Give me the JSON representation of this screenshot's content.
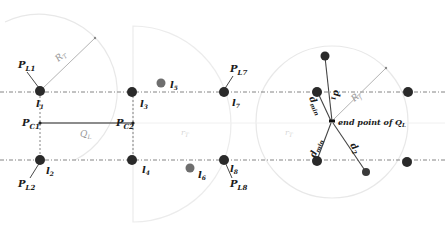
{
  "diagram": {
    "labels": {
      "PL1": {
        "main": "P",
        "sub": "L1"
      },
      "PL2": {
        "main": "P",
        "sub": "L2"
      },
      "PL7": {
        "main": "P",
        "sub": "L7"
      },
      "PL8": {
        "main": "P",
        "sub": "L8"
      },
      "PC1": {
        "main": "P",
        "sub": "C1"
      },
      "PC2": {
        "main": "P",
        "sub": "C2"
      },
      "RT": {
        "main": "R",
        "sub": "T"
      },
      "Rf": {
        "main": "R",
        "sub": "f"
      },
      "QL": {
        "main": "Q",
        "sub": "L"
      },
      "rT_mid": {
        "main": "r",
        "sub": "T"
      },
      "rT_right": {
        "main": "r",
        "sub": "T"
      },
      "l1": {
        "main": "l",
        "sub": "1"
      },
      "l2": {
        "main": "l",
        "sub": "2"
      },
      "l3": {
        "main": "l",
        "sub": "3"
      },
      "l4": {
        "main": "l",
        "sub": "4"
      },
      "l5": {
        "main": "l",
        "sub": "5"
      },
      "l6": {
        "main": "l",
        "sub": "6"
      },
      "l7": {
        "main": "l",
        "sub": "7"
      },
      "l8": {
        "main": "l",
        "sub": "8"
      },
      "d1": {
        "main": "d",
        "sub": "1"
      },
      "d2": {
        "main": "d",
        "sub": "2"
      },
      "dmin_upper": {
        "main": "d",
        "sub": "min"
      },
      "dmin_lower": {
        "main": "d",
        "sub": "min"
      },
      "endpoint": {
        "main": "end point of Q",
        "sub": "L"
      }
    },
    "colors": {
      "landmark": "#2a2a2a",
      "landmark_faint": "#6e6e6e",
      "line": "#555555",
      "circle": "#e6e6e6",
      "dashdot": "#777777"
    }
  }
}
